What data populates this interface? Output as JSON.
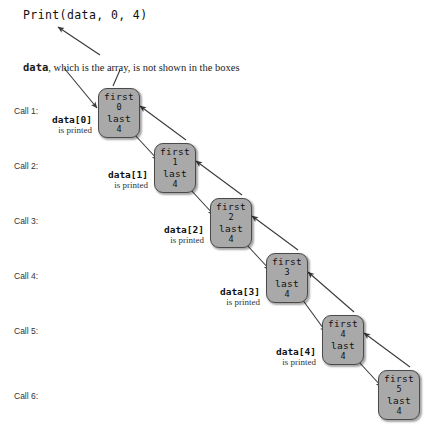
{
  "diagram": {
    "title_code": "Print(data, 0, 4)",
    "note": {
      "mono_part": "data",
      "rest_part": ", which is the array, is not shown in the boxes"
    },
    "call_labels": [
      {
        "text": "Call 1:",
        "top": 106
      },
      {
        "text": "Call 2:",
        "top": 161
      },
      {
        "text": "Call 3:",
        "top": 216
      },
      {
        "text": "Call 4:",
        "top": 271
      },
      {
        "text": "Call 5:",
        "top": 326
      },
      {
        "text": "Call 6:",
        "top": 391
      }
    ],
    "field_names": {
      "first": "first",
      "last": "last"
    },
    "frames": [
      {
        "first": "0",
        "last": "4",
        "left": 98,
        "top": 88
      },
      {
        "first": "1",
        "last": "4",
        "left": 154,
        "top": 143
      },
      {
        "first": "2",
        "last": "4",
        "left": 210,
        "top": 198
      },
      {
        "first": "3",
        "last": "4",
        "left": 266,
        "top": 253
      },
      {
        "first": "4",
        "last": "4",
        "left": 322,
        "top": 315
      },
      {
        "first": "5",
        "last": "4",
        "left": 378,
        "top": 370
      }
    ],
    "printed_labels": [
      {
        "index": "data[0]",
        "sub": "is printed",
        "left": 42,
        "top": 114
      },
      {
        "index": "data[1]",
        "sub": "is printed",
        "left": 98,
        "top": 169
      },
      {
        "index": "data[2]",
        "sub": "is printed",
        "left": 154,
        "top": 224
      },
      {
        "index": "data[3]",
        "sub": "is printed",
        "left": 210,
        "top": 286
      },
      {
        "index": "data[4]",
        "sub": "is printed",
        "left": 266,
        "top": 346
      }
    ],
    "colors": {
      "box_fill": "#a9a9a9",
      "box_border": "#4a4a4a",
      "arrow": "#3a3a3a",
      "text": "#1a1a1a"
    }
  }
}
